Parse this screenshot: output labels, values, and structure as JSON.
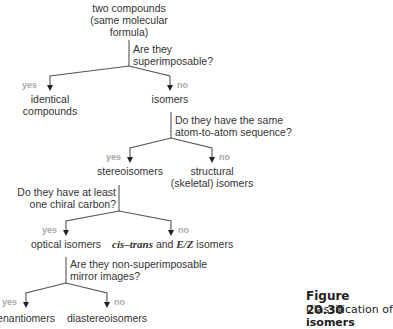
{
  "root": {
    "line1": "two compounds",
    "line2": "(same molecular",
    "line3": "formula)"
  },
  "q1": {
    "line1": "Are they",
    "line2": "superimposable?"
  },
  "n1_yes": {
    "label": "yes",
    "line1": "identical",
    "line2": "compounds"
  },
  "n1_no": {
    "label": "no",
    "line1": "isomers"
  },
  "q2": {
    "line1": "Do they have the same",
    "line2": "atom-to-atom sequence?"
  },
  "n2_yes": {
    "label": "yes",
    "line1": "stereoisomers"
  },
  "n2_no": {
    "label": "no",
    "line1": "structural",
    "line2": "(skeletal) isomers"
  },
  "q3": {
    "line1": "Do they have at least",
    "line2": "one chiral carbon?"
  },
  "n3_yes": {
    "label": "yes",
    "line1": "optical isomers"
  },
  "n3_no": {
    "label": "no",
    "italic1": "cis–trans",
    "mid": " and ",
    "italic2": "E/Z",
    "tail": " isomers"
  },
  "q4": {
    "line1": "Are they non-superimposable",
    "line2": "mirror images?"
  },
  "n4_yes": {
    "label": "yes",
    "line1": "enantiomers"
  },
  "n4_no": {
    "label": "no",
    "line1": "diastereoisomers"
  },
  "caption": {
    "title": "Figure 20.30",
    "text1": "Classification of",
    "text2": "isomers"
  },
  "colors": {
    "line": "#555555",
    "label": "#a8a8a8",
    "text": "#333333"
  }
}
